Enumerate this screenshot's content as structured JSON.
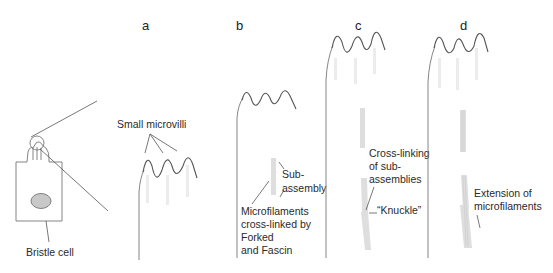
{
  "figure": {
    "panels": [
      {
        "id": "a",
        "label": "a"
      },
      {
        "id": "b",
        "label": "b"
      },
      {
        "id": "c",
        "label": "c"
      },
      {
        "id": "d",
        "label": "d"
      }
    ],
    "cell": {
      "label": "Bristle cell"
    },
    "annotations": {
      "small_microvilli": "Small microvilli",
      "sub_assembly": [
        "Sub-",
        "assembly"
      ],
      "microfilaments_crosslinked": [
        "Microfilaments",
        "cross-linked by",
        "Forked",
        "and Fascin"
      ],
      "crosslinking_subassemblies": [
        "Cross-linking",
        "of sub-",
        "assemblies"
      ],
      "knuckle": "“Knuckle”",
      "extension": [
        "Extension of",
        "microfilaments"
      ]
    },
    "colors": {
      "outline": "#777777",
      "wave": "#555555",
      "filament": "#dedede",
      "nucleus": "#c8c8c8",
      "text": "#2a2a2a"
    }
  }
}
